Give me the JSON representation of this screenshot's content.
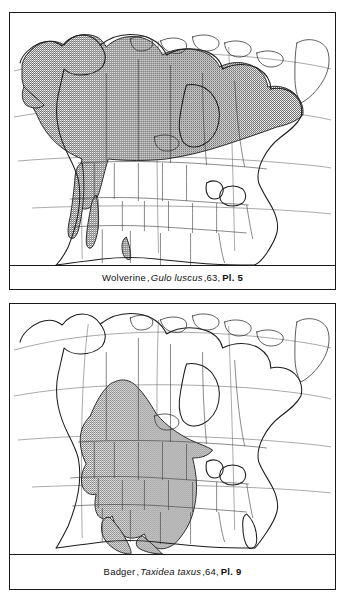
{
  "figure": {
    "panels": [
      {
        "id": "wolverine",
        "caption": {
          "common_name": "Wolverine",
          "separator1": ", ",
          "scientific_name": "Gulo luscus",
          "separator2": ", ",
          "page": "63",
          "separator3": ", ",
          "plate": "Pl. 5",
          "full_text": "Wolverine, Gulo luscus, 63, Pl. 5"
        },
        "map": {
          "region": "North America",
          "projection_note": "outline map with political boundaries and graticule",
          "shaded_area_label": "distribution range",
          "shading_style": "stipple",
          "range_description": "Alaska, most of Canada, Greenland excluded, extending south along the western mountains into the northwestern United States"
        }
      },
      {
        "id": "badger",
        "caption": {
          "common_name": "Badger",
          "separator1": ", ",
          "scientific_name": "Taxidea taxus",
          "separator2": ", ",
          "page": "64",
          "separator3": ", ",
          "plate": "Pl. 9",
          "full_text": "Badger, Taxidea taxus, 64, Pl. 9"
        },
        "map": {
          "region": "North America",
          "projection_note": "outline map with political boundaries and graticule",
          "shaded_area_label": "distribution range",
          "shading_style": "stipple",
          "range_description": "south-central and western Canadian prairies south through the western and central United States into northern Mexico"
        }
      }
    ]
  },
  "colors": {
    "frame": "#1a1a1a",
    "coastline": "#1c1c1c",
    "political_border": "#3a3a3a",
    "graticule": "#555555",
    "range_fill": "#9a9a9a",
    "land_fill": "#ffffff",
    "page_background": "#ffffff",
    "caption_text": "#111111"
  }
}
